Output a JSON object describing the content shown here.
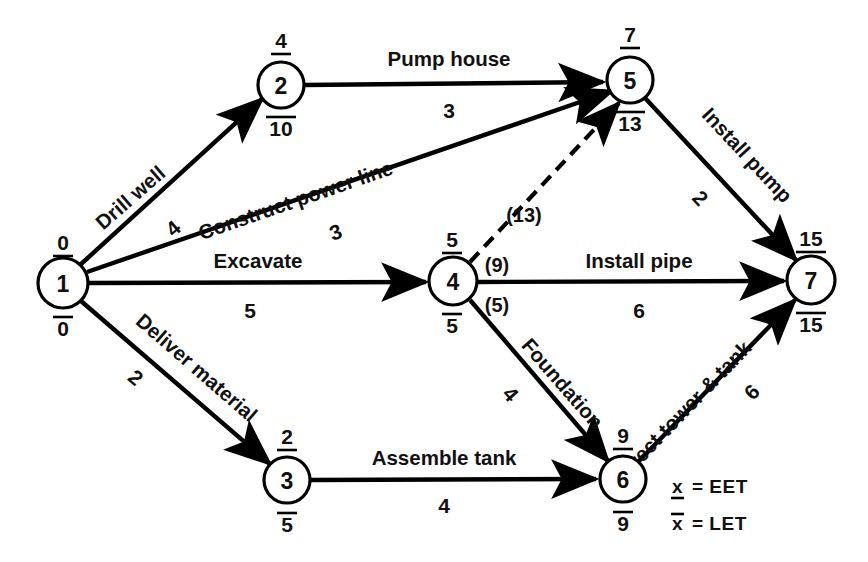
{
  "diagram": {
    "legend": [
      {
        "symbol": "x",
        "mark": "underline",
        "text": "= EET"
      },
      {
        "symbol": "x",
        "mark": "overline",
        "text": "= LET"
      }
    ],
    "nodes": [
      {
        "id": "1",
        "label": "1",
        "eet": "0",
        "let": "0",
        "cx": 63,
        "cy": 283,
        "r": 25
      },
      {
        "id": "2",
        "label": "2",
        "eet": "4",
        "let": "10",
        "cx": 281,
        "cy": 85,
        "r": 23
      },
      {
        "id": "3",
        "label": "3",
        "eet": "2",
        "let": "5",
        "cx": 287,
        "cy": 480,
        "r": 23
      },
      {
        "id": "4",
        "label": "4",
        "eet": "5",
        "let": "5",
        "cx": 453,
        "cy": 281,
        "r": 24
      },
      {
        "id": "5",
        "label": "5",
        "eet": "7",
        "let": "13",
        "cx": 630,
        "cy": 80,
        "r": 23
      },
      {
        "id": "6",
        "label": "6",
        "eet": "9",
        "let": "9",
        "cx": 623,
        "cy": 479,
        "r": 23
      },
      {
        "id": "7",
        "label": "7",
        "eet": "15",
        "let": "15",
        "cx": 811,
        "cy": 280,
        "r": 24
      }
    ],
    "edges": [
      {
        "id": "e1-2",
        "from": "1",
        "to": "2",
        "name": "Drill well",
        "duration": "4",
        "style": "solid"
      },
      {
        "id": "e1-5",
        "from": "1",
        "to": "5",
        "name": "Construct power line",
        "duration": "3",
        "style": "solid"
      },
      {
        "id": "e1-4",
        "from": "1",
        "to": "4",
        "name": "Excavate",
        "duration": "5",
        "style": "solid"
      },
      {
        "id": "e1-3",
        "from": "1",
        "to": "3",
        "name": "Deliver material",
        "duration": "2",
        "style": "solid"
      },
      {
        "id": "e2-5",
        "from": "2",
        "to": "5",
        "name": "Pump house",
        "duration": "3",
        "style": "solid"
      },
      {
        "id": "e4-5",
        "from": "4",
        "to": "5",
        "name": "",
        "duration": "",
        "style": "dashed"
      },
      {
        "id": "e4-7",
        "from": "4",
        "to": "7",
        "name": "Install pipe",
        "duration": "6",
        "style": "solid"
      },
      {
        "id": "e4-6",
        "from": "4",
        "to": "6",
        "name": "Foundation",
        "duration": "4",
        "style": "solid"
      },
      {
        "id": "e3-6",
        "from": "3",
        "to": "6",
        "name": "Assemble tank",
        "duration": "4",
        "style": "solid"
      },
      {
        "id": "e5-7",
        "from": "5",
        "to": "7",
        "name": "Install pump",
        "duration": "2",
        "style": "solid"
      },
      {
        "id": "e6-7",
        "from": "6",
        "to": "7",
        "name": "Erect tower & tank",
        "duration": "6",
        "style": "solid"
      }
    ],
    "branch_labels": [
      {
        "id": "b13",
        "text": "(13)",
        "x": 524,
        "y": 222
      },
      {
        "id": "b9",
        "text": "(9)",
        "x": 497,
        "y": 272
      },
      {
        "id": "b5",
        "text": "(5)",
        "x": 497,
        "y": 312
      }
    ]
  }
}
